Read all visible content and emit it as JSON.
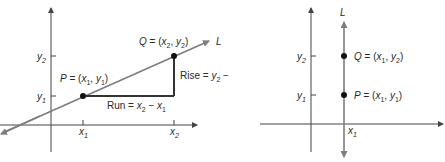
{
  "colors": {
    "axis": "#444444",
    "line": "#7d7d7d",
    "triangle": "#333333",
    "point": "#111111",
    "text": "#2a2a2a"
  },
  "left_diagram": {
    "line_label": "L",
    "point_p": {
      "name": "P",
      "x": "x",
      "x_sub": "1",
      "y": "y",
      "y_sub": "1"
    },
    "point_q": {
      "name": "Q",
      "x": "x",
      "x_sub": "2",
      "y": "y",
      "y_sub": "2"
    },
    "rise_label": {
      "prefix": "Rise = ",
      "a": "y",
      "a_sub": "2",
      "minus": " − ",
      "b": "y",
      "b_sub": "1"
    },
    "run_label": {
      "prefix": "Run = ",
      "a": "x",
      "a_sub": "2",
      "minus": " − ",
      "b": "x",
      "b_sub": "1"
    },
    "x_ticks": [
      {
        "v": "x",
        "sub": "1"
      },
      {
        "v": "x",
        "sub": "2"
      }
    ],
    "y_ticks": [
      {
        "v": "y",
        "sub": "1"
      },
      {
        "v": "y",
        "sub": "2"
      }
    ]
  },
  "right_diagram": {
    "line_label": "L",
    "point_p": {
      "name": "P",
      "x": "x",
      "x_sub": "1",
      "y": "y",
      "y_sub": "1"
    },
    "point_q": {
      "name": "Q",
      "x": "x",
      "x_sub": "1",
      "y": "y",
      "y_sub": "2"
    },
    "x_ticks": [
      {
        "v": "x",
        "sub": "1"
      }
    ],
    "y_ticks": [
      {
        "v": "y",
        "sub": "1"
      },
      {
        "v": "y",
        "sub": "2"
      }
    ]
  }
}
